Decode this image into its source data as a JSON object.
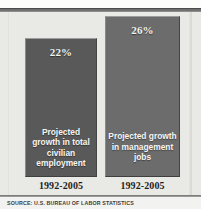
{
  "chart_data": {
    "type": "bar",
    "title": "",
    "xlabel": "",
    "ylabel": "",
    "categories": [
      "Projected growth in total civilian employment",
      "Projected growth in management jobs"
    ],
    "values": [
      22,
      26
    ],
    "value_labels": [
      "22%",
      "26%"
    ],
    "period_labels": [
      "1992-2005",
      "1992-2005"
    ],
    "ylim": [
      0,
      26
    ],
    "grid": false,
    "legend": "none",
    "bar_colors": [
      "#595959",
      "#6c6c6c"
    ],
    "background_color": "#e9e9e6",
    "source": "SOURCE: U.S. BUREAU OF LABOR STATISTICS"
  },
  "figure": {
    "bars": [
      {
        "percent_label": "22%",
        "caption": "Projected growth in total civilian employment",
        "period": "1992-2005"
      },
      {
        "percent_label": "26%",
        "caption": "Projected growth in management jobs",
        "period": "1992-2005"
      }
    ],
    "source_note": "SOURCE: U.S. BUREAU OF LABOR STATISTICS"
  }
}
